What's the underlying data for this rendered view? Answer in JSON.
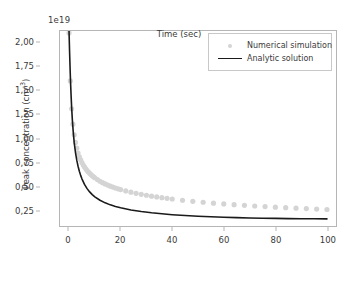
{
  "chart_data": {
    "type": "scatter",
    "title": "",
    "xlabel": "Time (sec)",
    "ylabel": "Peak concentration (cm",
    "ylabel_sup": "-3",
    "ylabel_suffix": ")",
    "y_offset_text": "1e19",
    "y_offset_value": 1e+19,
    "xlim": [
      -3.5,
      103.5
    ],
    "ylim": [
      0.09,
      2.12
    ],
    "xticks": [
      0,
      20,
      40,
      60,
      80,
      100
    ],
    "xtick_labels": [
      "0",
      "20",
      "40",
      "60",
      "80",
      "100"
    ],
    "yticks": [
      0.25,
      0.5,
      0.75,
      1.0,
      1.25,
      1.5,
      1.75,
      2.0
    ],
    "ytick_labels": [
      "0,25",
      "0,50",
      "0,75",
      "1,00",
      "1,25",
      "1,50",
      "1,75",
      "2,00"
    ],
    "grid": false,
    "legend_position": "upper right",
    "colors": {
      "scatter": "#d4d4d4",
      "line": "#1a1a1a",
      "axis": "#b5b5b5",
      "text": "#3a3a3a",
      "background": "#ffffff"
    },
    "series": [
      {
        "name": "Numerical simulation",
        "type": "scatter",
        "marker": "circle",
        "color": "#d4d4d4",
        "x": [
          0.0,
          0.5,
          1.0,
          1.5,
          2.0,
          2.5,
          3.0,
          3.5,
          4.0,
          4.5,
          5.0,
          5.5,
          6.0,
          6.5,
          7.0,
          7.5,
          8.0,
          8.5,
          9.0,
          9.5,
          10.0,
          11.0,
          12.0,
          13.0,
          14.0,
          15.0,
          16.0,
          17.0,
          18.0,
          19.0,
          20.0,
          22.0,
          24.0,
          26.0,
          28.0,
          30.0,
          32.0,
          34.0,
          36.0,
          38.0,
          40.0,
          44.0,
          48.0,
          52.0,
          56.0,
          60.0,
          64.0,
          68.0,
          72.0,
          76.0,
          80.0,
          84.0,
          88.0,
          92.0,
          96.0,
          100.0
        ],
        "y": [
          2.1,
          1.6,
          1.31,
          1.15,
          1.04,
          0.96,
          0.9,
          0.85,
          0.81,
          0.78,
          0.75,
          0.725,
          0.705,
          0.685,
          0.668,
          0.652,
          0.638,
          0.625,
          0.613,
          0.602,
          0.592,
          0.573,
          0.556,
          0.541,
          0.528,
          0.516,
          0.505,
          0.495,
          0.486,
          0.477,
          0.469,
          0.455,
          0.442,
          0.43,
          0.42,
          0.41,
          0.401,
          0.393,
          0.385,
          0.378,
          0.371,
          0.358,
          0.347,
          0.337,
          0.328,
          0.32,
          0.312,
          0.305,
          0.298,
          0.292,
          0.286,
          0.281,
          0.276,
          0.271,
          0.266,
          0.262
        ]
      },
      {
        "name": "Analytic solution",
        "type": "line",
        "color": "#1a1a1a",
        "x": [
          0.0,
          0.2,
          0.4,
          0.6,
          0.8,
          1.0,
          1.3,
          1.6,
          2.0,
          2.5,
          3.0,
          3.5,
          4.0,
          4.5,
          5.0,
          6.0,
          7.0,
          8.0,
          9.0,
          10.0,
          12.0,
          14.0,
          16.0,
          18.0,
          20.0,
          24.0,
          28.0,
          32.0,
          36.0,
          40.0,
          45.0,
          50.0,
          55.0,
          60.0,
          65.0,
          70.0,
          75.0,
          80.0,
          85.0,
          90.0,
          95.0,
          100.0
        ],
        "y": [
          2.12,
          1.92,
          1.74,
          1.58,
          1.45,
          1.33,
          1.19,
          1.08,
          0.96,
          0.855,
          0.775,
          0.712,
          0.66,
          0.617,
          0.581,
          0.523,
          0.479,
          0.445,
          0.417,
          0.394,
          0.358,
          0.331,
          0.31,
          0.293,
          0.279,
          0.257,
          0.24,
          0.227,
          0.217,
          0.208,
          0.199,
          0.192,
          0.186,
          0.181,
          0.177,
          0.174,
          0.171,
          0.169,
          0.167,
          0.166,
          0.165,
          0.164
        ]
      }
    ],
    "legend": [
      {
        "label": "Numerical simulation",
        "marker": "dot",
        "color": "#d4d4d4"
      },
      {
        "label": "Analytic solution",
        "marker": "line",
        "color": "#1a1a1a"
      }
    ]
  }
}
